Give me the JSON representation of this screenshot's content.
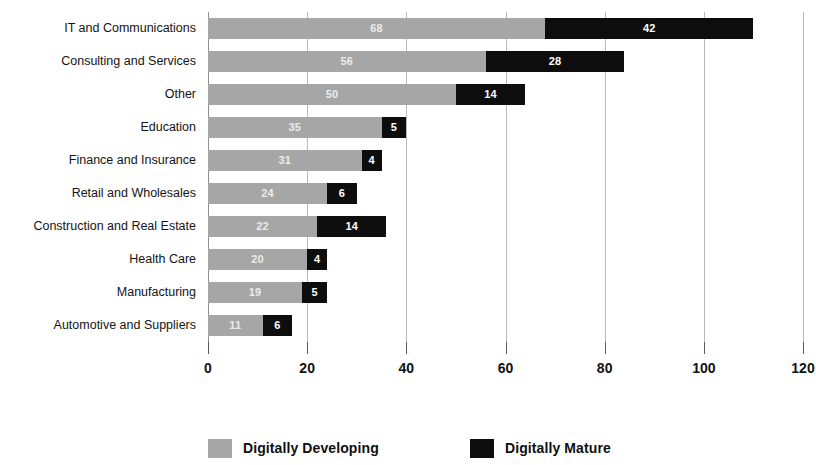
{
  "chart_data": {
    "type": "bar",
    "orientation": "horizontal",
    "stacked": true,
    "title": "",
    "xlabel": "",
    "ylabel": "",
    "xlim": [
      0,
      120
    ],
    "xticks": [
      0,
      20,
      40,
      60,
      80,
      100,
      120
    ],
    "xtick_labels": [
      "0",
      "20",
      "40",
      "60",
      "80",
      "100",
      "120"
    ],
    "grid": true,
    "grid_axis": "x",
    "legend_position": "bottom",
    "categories": [
      "IT and Communications",
      "Consulting and Services",
      "Other",
      "Education",
      "Finance and Insurance",
      "Retail and Wholesales",
      "Construction and Real Estate",
      "Health Care",
      "Manufacturing",
      "Automotive and Suppliers"
    ],
    "series": [
      {
        "name": "Digitally Developing",
        "color": "#a6a6a6",
        "values": [
          68,
          56,
          50,
          35,
          31,
          24,
          22,
          20,
          19,
          11
        ]
      },
      {
        "name": "Digitally Mature",
        "color": "#0d0d0d",
        "values": [
          42,
          28,
          14,
          5,
          4,
          6,
          14,
          4,
          5,
          6
        ]
      }
    ],
    "totals": [
      110,
      84,
      64,
      40,
      35,
      30,
      36,
      24,
      24,
      17
    ]
  },
  "legend": {
    "items": [
      {
        "label": "Digitally Developing",
        "swatch": "sw-developing"
      },
      {
        "label": "Digitally Mature",
        "swatch": "sw-mature"
      }
    ]
  }
}
